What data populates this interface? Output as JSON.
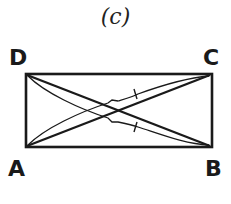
{
  "figure": {
    "label": "(c)"
  },
  "vertices": {
    "D": "D",
    "C": "C",
    "A": "A",
    "B": "B"
  },
  "rectangle": {
    "corners": [
      "A",
      "B",
      "C",
      "D"
    ],
    "diagonals": [
      "AC",
      "BD"
    ],
    "stroke_color": "#1a1a1a"
  },
  "annotations": {
    "equal_segment_marks": [
      "AC",
      "BD"
    ],
    "description": "Curved arcs along diagonals AC and BD with single tick marks indicating AC = BD"
  }
}
